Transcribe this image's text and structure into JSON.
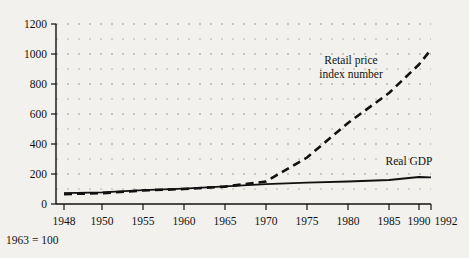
{
  "chart_data": {
    "type": "line",
    "title": "",
    "subtitle": "",
    "xlabel": "",
    "ylabel": "",
    "footnote": "1963 = 100",
    "grid": true,
    "legend_position": "inline-annotations",
    "xlim": [
      1948,
      1992
    ],
    "ylim": [
      0,
      1200
    ],
    "ytick_labels": [
      "0",
      "200",
      "400",
      "600",
      "800",
      "1000",
      "1200"
    ],
    "ytick_values": [
      0,
      200,
      400,
      600,
      800,
      1000,
      1200
    ],
    "xtick_labels": [
      "1948",
      "1950",
      "1955",
      "1960",
      "1965",
      "1970",
      "1975",
      "1980",
      "1985",
      "1990",
      "1992"
    ],
    "xtick_values": [
      1948,
      1950,
      1955,
      1960,
      1965,
      1970,
      1975,
      1980,
      1985,
      1990,
      1992
    ],
    "series": [
      {
        "name": "Retail price index number",
        "style": "dashed",
        "color": "#111111",
        "x": [
          1948,
          1950,
          1955,
          1960,
          1965,
          1970,
          1975,
          1980,
          1985,
          1990,
          1992
        ],
        "values": [
          66,
          72,
          90,
          100,
          116,
          150,
          310,
          540,
          740,
          930,
          1030
        ]
      },
      {
        "name": "Real GDP",
        "style": "solid",
        "color": "#111111",
        "x": [
          1948,
          1950,
          1955,
          1960,
          1965,
          1970,
          1975,
          1980,
          1985,
          1990,
          1992
        ],
        "values": [
          72,
          78,
          92,
          102,
          118,
          132,
          142,
          150,
          160,
          180,
          178
        ]
      }
    ],
    "annotations": [
      {
        "text_line1": "Retail price",
        "text_line2": "index number",
        "for_series": "Retail price index number"
      },
      {
        "text_line1": "Real GDP",
        "text_line2": "",
        "for_series": "Real GDP"
      }
    ]
  },
  "labels": {
    "y_1200": "1200",
    "y_1000": "1000",
    "y_800": "800",
    "y_600": "600",
    "y_400": "400",
    "y_200": "200",
    "y_0": "0",
    "x_1948": "1948",
    "x_1950": "1950",
    "x_1955": "1955",
    "x_1960": "1960",
    "x_1965": "1965",
    "x_1970": "1970",
    "x_1975": "1975",
    "x_1980": "1980",
    "x_1985": "1985",
    "x_1990": "1990",
    "x_1992": "1992",
    "retail_line1": "Retail price",
    "retail_line2": "index number",
    "gdp_label": "Real GDP",
    "footnote": "1963 = 100"
  }
}
